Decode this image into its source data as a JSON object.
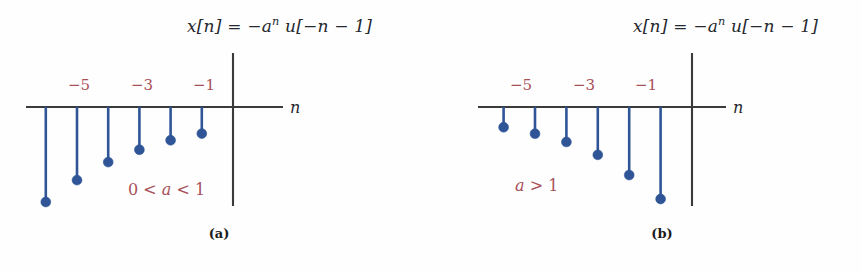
{
  "figure": {
    "width": 861,
    "height": 273,
    "background_color": "#fefefe",
    "stem_color": "#2f5597",
    "axis_color": "#3b3b3b",
    "label_color": "#a8505a",
    "text_color": "#26292e"
  },
  "panels": [
    {
      "id": "a",
      "caption": "(a)",
      "equation_parts": {
        "lhs": "x[n] = −a",
        "exponent": "n",
        "rhs": " u[−n − 1]"
      },
      "equation_plain": "x[n] = −a^n u[−n − 1]",
      "axis_label": "n",
      "condition_parts": {
        "lead": "0 < ",
        "symbol": "a",
        "tail": " < 1"
      },
      "condition_plain": "0 < a < 1",
      "tick_labels": [
        "−5",
        "−3",
        "−1"
      ],
      "chart_data": {
        "type": "stem",
        "title": "x[n] = −a^n u[−n − 1], 0 < a < 1",
        "xlabel": "n",
        "ylabel": "",
        "xlim": [
          -6.8,
          1.6
        ],
        "ylim": [
          -1.05,
          0.15
        ],
        "grid": false,
        "legend": null,
        "x": [
          -6,
          -5,
          -4,
          -3,
          -2,
          -1
        ],
        "values": [
          -1.0,
          -0.77,
          -0.58,
          -0.45,
          -0.35,
          -0.28
        ],
        "labeled_ticks": [
          -5,
          -3,
          -1
        ],
        "note": "Decaying-magnitude negative stems; magnitude decreases toward n = −1."
      }
    },
    {
      "id": "b",
      "caption": "(b)",
      "equation_parts": {
        "lhs": "x[n] = −a",
        "exponent": "n",
        "rhs": " u[−n − 1]"
      },
      "equation_plain": "x[n] = −a^n u[−n − 1]",
      "axis_label": "n",
      "condition_parts": {
        "lead": "",
        "symbol": "a",
        "tail": " > 1"
      },
      "condition_plain": "a > 1",
      "tick_labels": [
        "−5",
        "−3",
        "−1"
      ],
      "chart_data": {
        "type": "stem",
        "title": "x[n] = −a^n u[−n − 1], a > 1",
        "xlabel": "n",
        "ylabel": "",
        "xlim": [
          -6.8,
          1.6
        ],
        "ylim": [
          -1.05,
          0.15
        ],
        "grid": false,
        "legend": null,
        "x": [
          -6,
          -5,
          -4,
          -3,
          -2,
          -1
        ],
        "values": [
          -0.22,
          -0.29,
          -0.38,
          -0.52,
          -0.74,
          -1.0
        ],
        "labeled_ticks": [
          -5,
          -3,
          -1
        ],
        "note": "Growing-magnitude negative stems; magnitude increases toward n = −1."
      }
    }
  ]
}
